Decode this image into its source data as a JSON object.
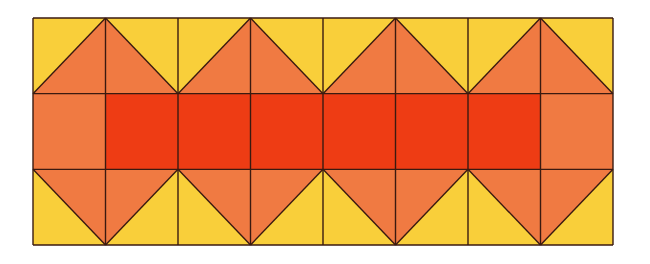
{
  "diagram": {
    "type": "tessellation-pattern",
    "grid": {
      "columns": 8,
      "rows": 3,
      "left": 33,
      "top": 18,
      "width": 580,
      "height": 227
    },
    "colors": {
      "yellow": "#F9CF3A",
      "orange": "#F07A42",
      "red": "#EE3C14",
      "line": "#3A1A10"
    },
    "rows": [
      {
        "name": "top-row",
        "kind": "triangles",
        "apex": "top",
        "apex_columns": [
          1,
          3,
          5,
          7
        ]
      },
      {
        "name": "middle-row",
        "kind": "squares",
        "cell_colors": [
          "orange",
          "red",
          "red",
          "red",
          "red",
          "red",
          "red",
          "orange"
        ]
      },
      {
        "name": "bottom-row",
        "kind": "triangles",
        "apex": "bottom",
        "apex_columns": [
          1,
          3,
          5,
          7
        ]
      }
    ]
  }
}
